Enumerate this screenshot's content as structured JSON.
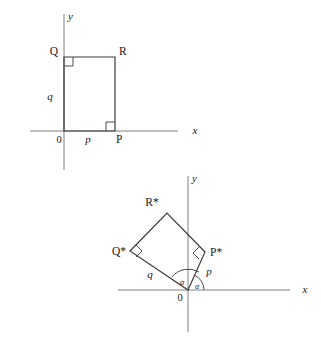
{
  "figure": {
    "background_color": "#ffffff",
    "axis_color": "#808080",
    "shape_color": "#3c3c3c",
    "text_color": "#1a1a1a"
  },
  "diagram_top": {
    "name": "original-rectangle",
    "axis_x_label": "x",
    "axis_y_label": "y",
    "origin_label": "0",
    "vertices": [
      {
        "key": "Q",
        "label": "Q",
        "x": 64,
        "y": 57
      },
      {
        "key": "R",
        "label": "R",
        "x": 115,
        "y": 57
      },
      {
        "key": "P",
        "label": "P",
        "x": 115,
        "y": 131
      },
      {
        "key": "O",
        "label": "0",
        "x": 64,
        "y": 131
      }
    ],
    "side_labels": [
      {
        "key": "q",
        "label": "q",
        "x": 48,
        "y": 98
      },
      {
        "key": "p",
        "label": "p",
        "x": 87,
        "y": 142
      }
    ],
    "right_angles": [
      {
        "key": "angle-at-Q",
        "x": 64,
        "y": 57
      },
      {
        "key": "angle-at-P",
        "x": 115,
        "y": 131
      }
    ]
  },
  "diagram_bottom": {
    "name": "rotated-rectangle",
    "axis_x_label": "x",
    "axis_y_label": "y",
    "origin_label": "0",
    "vertices": [
      {
        "key": "R-star",
        "label": "R*",
        "x": 167,
        "y": 213
      },
      {
        "key": "Q-star",
        "label": "Q*",
        "x": 130,
        "y": 251
      },
      {
        "key": "P-star",
        "label": "P*",
        "x": 205,
        "y": 252
      },
      {
        "key": "O",
        "label": "0",
        "x": 188,
        "y": 290
      }
    ],
    "side_labels": [
      {
        "key": "q",
        "label": "q",
        "x": 152,
        "y": 275
      },
      {
        "key": "p",
        "label": "p",
        "x": 206,
        "y": 273
      }
    ],
    "angle_labels": [
      {
        "key": "alpha-interior",
        "label": "α",
        "x": 183,
        "y": 283
      },
      {
        "key": "alpha-x-axis",
        "label": "α",
        "x": 196,
        "y": 288
      }
    ],
    "right_angles": [
      {
        "key": "angle-at-Q-star",
        "x": 130,
        "y": 251
      },
      {
        "key": "angle-at-P-star",
        "x": 205,
        "y": 252
      }
    ]
  }
}
